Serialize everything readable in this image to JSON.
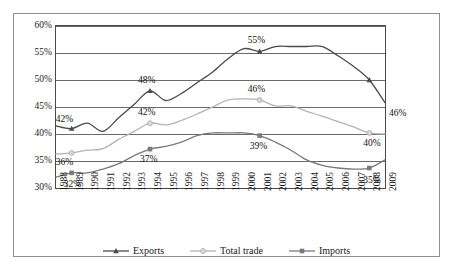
{
  "chart_data": {
    "type": "line",
    "title": "",
    "subtitle": "",
    "xlabel": "",
    "ylabel": "",
    "x": [
      1988,
      1989,
      1990,
      1991,
      1992,
      1993,
      1994,
      1995,
      1996,
      1997,
      1998,
      1999,
      2000,
      2001,
      2002,
      2003,
      2004,
      2005,
      2006,
      2007,
      2008,
      2009
    ],
    "categories": [
      "1988",
      "1989",
      "1990",
      "1991",
      "1992",
      "1993",
      "1994",
      "1995",
      "1996",
      "1997",
      "1998",
      "1999",
      "2000",
      "2001",
      "2002",
      "2003",
      "2004",
      "2005",
      "2006",
      "2007",
      "2008",
      "2009"
    ],
    "ylim": [
      30,
      60
    ],
    "yticks": [
      30,
      35,
      40,
      45,
      50,
      55,
      60
    ],
    "ytick_labels": [
      "30%",
      "35%",
      "40%",
      "45%",
      "50%",
      "55%",
      "60%"
    ],
    "grid": true,
    "grid_axis": "y",
    "legend_position": "bottom",
    "series": [
      {
        "name": "Exports",
        "marker": "triangle",
        "color": "#4a4a4a",
        "values": [
          41.5,
          41.0,
          42.0,
          40.5,
          43.0,
          45.5,
          48.0,
          46.2,
          47.5,
          49.5,
          51.5,
          54.0,
          55.8,
          55.3,
          56.2,
          56.2,
          56.2,
          56.2,
          54.5,
          52.5,
          50.0,
          45.8
        ]
      },
      {
        "name": "Total trade",
        "marker": "circle",
        "color": "#b3b3b3",
        "values": [
          36.3,
          36.5,
          37.0,
          37.3,
          39.0,
          40.5,
          42.0,
          41.7,
          42.5,
          43.7,
          45.0,
          46.3,
          46.5,
          46.3,
          45.2,
          45.2,
          44.2,
          43.3,
          42.3,
          41.3,
          40.2,
          40.0
        ]
      },
      {
        "name": "Imports",
        "marker": "square",
        "color": "#7a7a7a",
        "values": [
          32.0,
          32.8,
          32.8,
          33.5,
          34.5,
          36.0,
          37.2,
          37.7,
          38.5,
          39.7,
          40.2,
          40.2,
          40.2,
          39.7,
          38.5,
          37.0,
          35.2,
          34.2,
          33.7,
          33.5,
          33.7,
          35.2
        ]
      }
    ],
    "annotations": [
      {
        "text": "42%",
        "series": "Exports",
        "x": 1989,
        "value": 41.0
      },
      {
        "text": "48%",
        "series": "Exports",
        "x": 1994,
        "value": 48.0
      },
      {
        "text": "55%",
        "series": "Exports",
        "x": 2001,
        "value": 55.3
      },
      {
        "text": "46%",
        "series": "Exports",
        "x": 2009,
        "value": 45.8
      },
      {
        "text": "36%",
        "series": "Total trade",
        "x": 1989,
        "value": 36.5
      },
      {
        "text": "42%",
        "series": "Total trade",
        "x": 1994,
        "value": 42.0
      },
      {
        "text": "46%",
        "series": "Total trade",
        "x": 2001,
        "value": 46.3
      },
      {
        "text": "40%",
        "series": "Total trade",
        "x": 2008,
        "value": 40.2
      },
      {
        "text": "32%",
        "series": "Imports",
        "x": 1989,
        "value": 32.8
      },
      {
        "text": "37%",
        "series": "Imports",
        "x": 1994,
        "value": 37.2
      },
      {
        "text": "39%",
        "series": "Imports",
        "x": 2001,
        "value": 39.7
      },
      {
        "text": "35%",
        "series": "Imports",
        "x": 2008,
        "value": 33.7
      }
    ]
  },
  "legend": {
    "items": [
      {
        "label": "Exports",
        "marker": "triangle-marker",
        "color": "#4a4a4a"
      },
      {
        "label": "Total trade",
        "marker": "circle-marker",
        "color": "#b3b3b3"
      },
      {
        "label": "Imports",
        "marker": "square-marker",
        "color": "#7a7a7a"
      }
    ]
  },
  "colors": {
    "frame": "#8f8f8f",
    "plot_border": "#4a4a4a",
    "gridline": "#6b6b6b",
    "text": "#1a1a1a",
    "background": "#ffffff"
  }
}
